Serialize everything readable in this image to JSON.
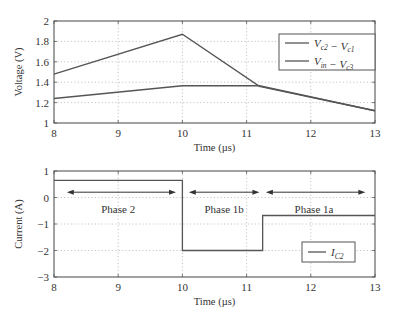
{
  "chart_data": [
    {
      "type": "line",
      "title": "",
      "xlabel": "Time (µs)",
      "ylabel": "Voltage (V)",
      "xlim": [
        8,
        13
      ],
      "ylim": [
        1,
        2
      ],
      "xticks": [
        8,
        9,
        10,
        11,
        12,
        13
      ],
      "yticks": [
        1,
        1.2,
        1.4,
        1.6,
        1.8,
        2
      ],
      "ytick_labels": [
        "1",
        "1.2",
        "1.4",
        "1.6",
        "1.8",
        "2"
      ],
      "grid": true,
      "legend_position": "upper right",
      "series": [
        {
          "name": "V_c2 − V_c1",
          "legend_main": [
            "V",
            " − V"
          ],
          "legend_subs": [
            "c2",
            "c1"
          ],
          "x": [
            8,
            10,
            11.2,
            13
          ],
          "y": [
            1.48,
            1.87,
            1.36,
            1.12
          ]
        },
        {
          "name": "V_in − V_c3",
          "legend_main": [
            "V",
            " − V"
          ],
          "legend_subs": [
            "in",
            "c3"
          ],
          "x": [
            8,
            10,
            11.2,
            13
          ],
          "y": [
            1.24,
            1.365,
            1.365,
            1.12
          ]
        }
      ]
    },
    {
      "type": "line",
      "title": "",
      "xlabel": "Time (µs)",
      "ylabel": "Current (A)",
      "xlim": [
        8,
        13
      ],
      "ylim": [
        -3,
        1
      ],
      "xticks": [
        8,
        9,
        10,
        11,
        12,
        13
      ],
      "yticks": [
        -3,
        -2,
        -1,
        0,
        1
      ],
      "ytick_labels": [
        "−3",
        "−2",
        "−1",
        "0",
        "1"
      ],
      "grid": true,
      "legend_position": "lower right",
      "series": [
        {
          "name": "I_C2",
          "legend_main": [
            "I"
          ],
          "legend_subs": [
            "C2"
          ],
          "step": true,
          "x": [
            8,
            10,
            10,
            11.25,
            11.25,
            13
          ],
          "y": [
            0.65,
            0.65,
            -2,
            -2,
            -0.68,
            -0.68
          ]
        }
      ],
      "annotations": [
        {
          "label": "Phase 2",
          "x_start": 8.2,
          "x_end": 9.9,
          "arrow_y": 0.2,
          "text_x": 9.0,
          "text_y": -0.45
        },
        {
          "label": "Phase 1b",
          "x_start": 10.1,
          "x_end": 11.2,
          "arrow_y": 0.2,
          "text_x": 10.65,
          "text_y": -0.45
        },
        {
          "label": "Phase 1a",
          "x_start": 11.3,
          "x_end": 12.85,
          "arrow_y": 0.2,
          "text_x": 12.05,
          "text_y": -0.45
        }
      ]
    }
  ],
  "layout": {
    "panels": [
      {
        "left": 54,
        "right": 375,
        "top": 21,
        "bottom": 123,
        "legend": {
          "x": 279,
          "y": 34,
          "w": 96,
          "h": 36
        }
      },
      {
        "left": 54,
        "right": 375,
        "top": 171,
        "bottom": 277,
        "legend": {
          "x": 302,
          "y": 242,
          "w": 53,
          "h": 20
        }
      }
    ]
  }
}
